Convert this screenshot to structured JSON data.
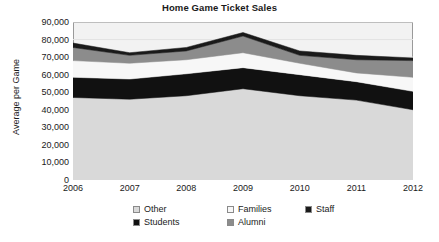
{
  "chart": {
    "title": "Home Game Ticket Sales",
    "ylabel": "Average per Game",
    "xlabel": ""
  },
  "axis": {
    "y_ticks": [
      "90,000",
      "80,000",
      "70,000",
      "60,000",
      "50,000",
      "40,000",
      "30,000",
      "20,000",
      "10,000",
      "0"
    ],
    "x_ticks": [
      "2006",
      "2007",
      "2008",
      "2009",
      "2010",
      "2011",
      "2012"
    ]
  },
  "legend": {
    "items": [
      {
        "label": "Other",
        "color": "#d9d9d9"
      },
      {
        "label": "Families",
        "color": "#f7f7f7"
      },
      {
        "label": "Staff",
        "color": "#1a1a1a"
      },
      {
        "label": "Students",
        "color": "#111111"
      },
      {
        "label": "Alumni",
        "color": "#8c8c8c"
      }
    ]
  },
  "colors": {
    "plot_background": "#f2f2f2",
    "plot_border": "#9a9a9a",
    "gridline": "#e2e2e2",
    "text": "#1a1a1a"
  },
  "chart_data": {
    "type": "area",
    "stacked": true,
    "title": "Home Game Ticket Sales",
    "xlabel": "",
    "ylabel": "Average per Game",
    "ylim": [
      0,
      90000
    ],
    "ytick_step": 10000,
    "grid": true,
    "legend_position": "bottom",
    "categories": [
      "2006",
      "2007",
      "2008",
      "2009",
      "2010",
      "2011",
      "2012"
    ],
    "stack_order_bottom_to_top": [
      "Other",
      "Students",
      "Families",
      "Alumni",
      "Staff"
    ],
    "series": [
      {
        "name": "Other",
        "color": "#d9d9d9",
        "values": [
          47000,
          46000,
          48000,
          52000,
          48000,
          45500,
          40000
        ]
      },
      {
        "name": "Students",
        "color": "#111111",
        "values": [
          11500,
          11500,
          12500,
          12000,
          12000,
          10500,
          10500
        ]
      },
      {
        "name": "Families",
        "color": "#f7f7f7",
        "values": [
          9500,
          9000,
          8000,
          8500,
          6500,
          5000,
          8000
        ]
      },
      {
        "name": "Alumni",
        "color": "#8c8c8c",
        "values": [
          7500,
          4500,
          5000,
          9500,
          4500,
          7500,
          9500
        ]
      },
      {
        "name": "Staff",
        "color": "#1a1a1a",
        "values": [
          2500,
          1500,
          2000,
          2000,
          2500,
          2500,
          1500
        ]
      }
    ],
    "totals": [
      78000,
      72500,
      75500,
      84000,
      73500,
      71000,
      69500
    ]
  }
}
